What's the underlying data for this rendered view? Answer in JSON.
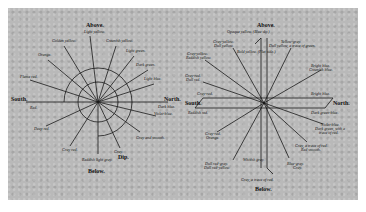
{
  "figure": {
    "left_diagram": {
      "directions": {
        "above": "Above.",
        "below": "Below.",
        "south": "South.",
        "north": "North.",
        "dip": "Dip."
      },
      "labels": [
        {
          "text": "Light yellow.",
          "x": 76,
          "y": 22
        },
        {
          "text": "Golden yellow.",
          "x": 44,
          "y": 31
        },
        {
          "text": "Greenish yellow.",
          "x": 98,
          "y": 31
        },
        {
          "text": "Light green.",
          "x": 118,
          "y": 41
        },
        {
          "text": "Orange.",
          "x": 30,
          "y": 45
        },
        {
          "text": "Dark green.",
          "x": 128,
          "y": 55
        },
        {
          "text": "Flame red.",
          "x": 12,
          "y": 67
        },
        {
          "text": "Light blue.",
          "x": 136,
          "y": 69
        },
        {
          "text": "Red.",
          "x": 22,
          "y": 91
        },
        {
          "text": "Dark blue.",
          "x": 148,
          "y": 87
        },
        {
          "text": "Violet-blue.",
          "x": 146,
          "y": 99
        },
        {
          "text": "Deep red.",
          "x": 26,
          "y": 113
        },
        {
          "text": "Gray and smooth.",
          "x": 132,
          "y": 125
        },
        {
          "text": "Gray red.",
          "x": 54,
          "y": 137
        },
        {
          "text": "Gray.",
          "x": 108,
          "y": 139
        },
        {
          "text": "Reddish light gray.",
          "x": 76,
          "y": 147
        }
      ]
    },
    "right_diagram": {
      "directions": {
        "above": "Above.",
        "below": "Below.",
        "south": "South.",
        "north": "North."
      },
      "labels": [
        {
          "text": "Opaque yellow. (Blue sky.)",
          "x": 44,
          "y": 22
        },
        {
          "text": "Gray-yellow.",
          "x": 30,
          "y": 32
        },
        {
          "text": "Dull yellow.",
          "x": 31,
          "y": 36
        },
        {
          "text": "Yellow-gray.",
          "x": 98,
          "y": 32
        },
        {
          "text": "Dull yellow, a trace of green.",
          "x": 86,
          "y": 36
        },
        {
          "text": "Bold yellow. (Flat side.)",
          "x": 54,
          "y": 42
        },
        {
          "text": "Gray-yellow.",
          "x": 4,
          "y": 44
        },
        {
          "text": "Reddish yellow.",
          "x": 3,
          "y": 48
        },
        {
          "text": "Bright blue.",
          "x": 128,
          "y": 56
        },
        {
          "text": "Greenish blue.",
          "x": 126,
          "y": 60
        },
        {
          "text": "Gray-red.",
          "x": 2,
          "y": 66
        },
        {
          "text": "Dull red.",
          "x": 3,
          "y": 70
        },
        {
          "text": "Gray-red.",
          "x": 14,
          "y": 88
        },
        {
          "text": "Bright blue.",
          "x": 128,
          "y": 88
        },
        {
          "text": "Reddish red.",
          "x": 5,
          "y": 103
        },
        {
          "text": "Dark green-blue.",
          "x": 128,
          "y": 103
        },
        {
          "text": "Violet-blue.",
          "x": 138,
          "y": 115
        },
        {
          "text": "Dark green, with a",
          "x": 132,
          "y": 119
        },
        {
          "text": "trace of red.",
          "x": 136,
          "y": 123
        },
        {
          "text": "Gray-red.",
          "x": 22,
          "y": 124
        },
        {
          "text": "Orange.",
          "x": 23,
          "y": 128
        },
        {
          "text": "Gray, a trace of red.",
          "x": 112,
          "y": 136
        },
        {
          "text": "Red smooth.",
          "x": 118,
          "y": 140
        },
        {
          "text": "Whitish gray.",
          "x": 60,
          "y": 150
        },
        {
          "text": "Dull red-gray.",
          "x": 22,
          "y": 154
        },
        {
          "text": "Dull red-yellow.",
          "x": 21,
          "y": 158
        },
        {
          "text": "Blue-gray.",
          "x": 104,
          "y": 154
        },
        {
          "text": "Gray.",
          "x": 110,
          "y": 158
        },
        {
          "text": "Gray, a trace of red.",
          "x": 60,
          "y": 170
        }
      ]
    }
  }
}
